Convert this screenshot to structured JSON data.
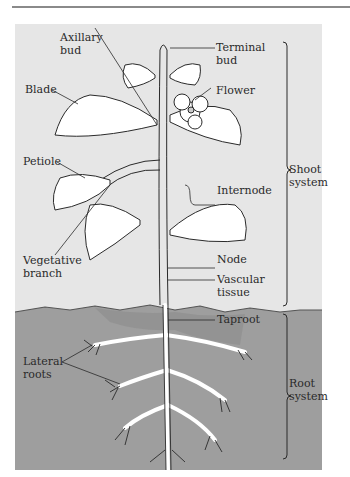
{
  "figure": {
    "colors": {
      "sky": "#e6e6e6",
      "soil": "#9e9e9e",
      "soil_top": "#8a8a8a",
      "line": "#2a2a2a",
      "leaf": "#ffffff"
    }
  },
  "labels": {
    "axillary_bud": [
      "Axillary",
      "bud"
    ],
    "terminal_bud": [
      "Terminal",
      "bud"
    ],
    "blade": "Blade",
    "flower": "Flower",
    "petiole": "Petiole",
    "internode": "Internode",
    "vegetative_branch": [
      "Vegetative",
      "branch"
    ],
    "node": "Node",
    "vascular_tissue": [
      "Vascular",
      "tissue"
    ],
    "taproot": "Taproot",
    "lateral_roots": [
      "Lateral",
      "roots"
    ],
    "shoot_system": [
      "Shoot",
      "system"
    ],
    "root_system": [
      "Root",
      "system"
    ]
  }
}
